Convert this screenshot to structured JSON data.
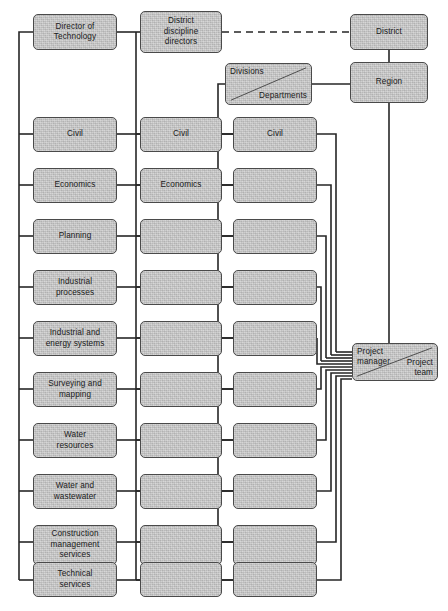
{
  "diagram": {
    "style": {
      "node_fill": "#c9c9c9",
      "node_border": "#4a4a4a",
      "line_color": "#262626",
      "background": "#ffffff",
      "text_color": "#1a1a1a"
    }
  },
  "header": {
    "director_of_technology": "Director of\nTechnology",
    "district_discipline_directors": "District\ndiscipline\ndirectors",
    "district": "District",
    "region": "Region",
    "divisions": "Divisions",
    "departments": "Departments"
  },
  "right": {
    "project_manager": "Project\nmanager",
    "project_team": "Project\nteam"
  },
  "columns": {
    "discipline": {
      "name": "Disciplines (corporate)",
      "rows": [
        "Civil",
        "Economics",
        "Planning",
        "Industrial\nprocesses",
        "Industrial and\nenergy systems",
        "Surveying and\nmapping",
        "Water\nresources",
        "Water and\nwastewater",
        "Construction\nmanagement\nservices",
        "Technical\nservices"
      ]
    },
    "district_discipline": {
      "name": "District disciplines",
      "rows": [
        "Civil",
        "Economics",
        "",
        "",
        "",
        "",
        "",
        "",
        "",
        ""
      ]
    },
    "division_department": {
      "name": "Divisions / Departments",
      "rows": [
        "Civil",
        "",
        "",
        "",
        "",
        "",
        "",
        "",
        "",
        ""
      ]
    }
  },
  "connections": {
    "dashed_link": "District discipline directors — District",
    "note": "Disciplines spine links Director of Technology to all corporate disciplines; each division/department routes to Project manager."
  }
}
